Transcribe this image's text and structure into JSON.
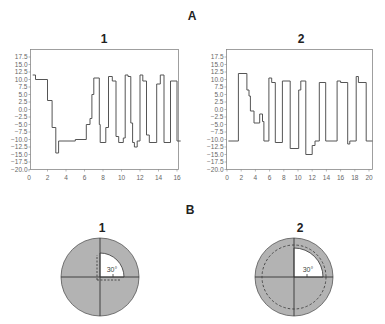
{
  "panels": {
    "A_label": "A",
    "B_label": "B"
  },
  "chart_data": [
    {
      "type": "line",
      "title": "1",
      "step": true,
      "xlabel": "",
      "ylabel": "",
      "xlim": [
        0,
        16.4
      ],
      "ylim": [
        -20,
        20
      ],
      "xticks": [
        0,
        2,
        4,
        6,
        8,
        10,
        12,
        14,
        16
      ],
      "yticks": [
        17.5,
        15.0,
        12.5,
        10.0,
        7.5,
        5.0,
        2.5,
        0.0,
        -2.5,
        -5.0,
        -7.5,
        -10.0,
        -12.5,
        -15.0,
        -17.5,
        -20.0
      ],
      "grid": false,
      "color": "#555555",
      "points": [
        [
          0.4,
          11.5
        ],
        [
          0.7,
          11.5
        ],
        [
          0.7,
          10.0
        ],
        [
          2.0,
          10.0
        ],
        [
          2.0,
          3.0
        ],
        [
          2.5,
          3.0
        ],
        [
          2.5,
          -6.0
        ],
        [
          2.9,
          -6.0
        ],
        [
          2.9,
          -14.5
        ],
        [
          3.2,
          -14.5
        ],
        [
          3.2,
          -10.5
        ],
        [
          5.0,
          -10.5
        ],
        [
          5.0,
          -10.0
        ],
        [
          6.2,
          -10.0
        ],
        [
          6.2,
          -5.0
        ],
        [
          6.6,
          -5.0
        ],
        [
          6.6,
          -3.0
        ],
        [
          6.8,
          -3.0
        ],
        [
          6.8,
          5.0
        ],
        [
          7.0,
          5.0
        ],
        [
          7.0,
          10.5
        ],
        [
          7.6,
          10.5
        ],
        [
          7.6,
          -5.0
        ],
        [
          7.7,
          -5.0
        ],
        [
          7.7,
          -11.0
        ],
        [
          8.3,
          -11.0
        ],
        [
          8.3,
          -6.0
        ],
        [
          8.6,
          -6.0
        ],
        [
          8.6,
          11.0
        ],
        [
          9.0,
          11.0
        ],
        [
          9.0,
          9.5
        ],
        [
          9.4,
          9.5
        ],
        [
          9.4,
          -9.0
        ],
        [
          9.7,
          -9.0
        ],
        [
          9.7,
          -11.0
        ],
        [
          10.2,
          -11.0
        ],
        [
          10.2,
          -9.5
        ],
        [
          10.4,
          -9.5
        ],
        [
          10.4,
          11.5
        ],
        [
          10.7,
          11.5
        ],
        [
          10.7,
          11.0
        ],
        [
          11.0,
          11.0
        ],
        [
          11.0,
          -4.5
        ],
        [
          11.2,
          -4.5
        ],
        [
          11.2,
          -11.0
        ],
        [
          11.4,
          -11.0
        ],
        [
          11.4,
          -12.5
        ],
        [
          11.7,
          -12.5
        ],
        [
          11.7,
          -10.5
        ],
        [
          12.0,
          -10.5
        ],
        [
          12.0,
          11.5
        ],
        [
          12.3,
          11.5
        ],
        [
          12.3,
          9.5
        ],
        [
          12.7,
          9.5
        ],
        [
          12.7,
          -8.5
        ],
        [
          13.0,
          -8.5
        ],
        [
          13.0,
          -11.0
        ],
        [
          13.8,
          -11.0
        ],
        [
          13.8,
          8.5
        ],
        [
          14.2,
          8.5
        ],
        [
          14.2,
          11.5
        ],
        [
          14.6,
          11.5
        ],
        [
          14.6,
          -11.0
        ],
        [
          15.3,
          -11.0
        ],
        [
          15.3,
          9.5
        ],
        [
          16.0,
          9.5
        ],
        [
          16.0,
          -10.5
        ],
        [
          16.4,
          -10.5
        ]
      ]
    },
    {
      "type": "line",
      "title": "2",
      "step": true,
      "xlabel": "",
      "ylabel": "",
      "xlim": [
        0,
        20.5
      ],
      "ylim": [
        -20,
        20
      ],
      "xticks": [
        0,
        2,
        4,
        6,
        8,
        10,
        12,
        14,
        16,
        18,
        20
      ],
      "yticks": [
        17.5,
        15.0,
        12.5,
        10.0,
        7.5,
        5.0,
        2.5,
        0.0,
        -2.5,
        -5.0,
        -7.5,
        -10.0,
        -12.5,
        -15.0,
        -17.5,
        -20.0
      ],
      "grid": false,
      "color": "#555555",
      "points": [
        [
          0.2,
          -10.5
        ],
        [
          1.6,
          -10.5
        ],
        [
          1.6,
          12.0
        ],
        [
          2.8,
          12.0
        ],
        [
          2.8,
          6.5
        ],
        [
          3.1,
          6.5
        ],
        [
          3.1,
          4.5
        ],
        [
          3.3,
          4.5
        ],
        [
          3.3,
          -0.5
        ],
        [
          3.8,
          -0.5
        ],
        [
          3.8,
          -4.5
        ],
        [
          4.6,
          -4.5
        ],
        [
          4.6,
          -1.5
        ],
        [
          5.0,
          -1.5
        ],
        [
          5.0,
          -4.0
        ],
        [
          5.2,
          -4.0
        ],
        [
          5.2,
          -10.5
        ],
        [
          5.9,
          -10.5
        ],
        [
          5.9,
          10.5
        ],
        [
          6.3,
          10.5
        ],
        [
          6.3,
          9.0
        ],
        [
          6.8,
          9.0
        ],
        [
          6.8,
          -11.0
        ],
        [
          7.8,
          -11.0
        ],
        [
          7.8,
          9.5
        ],
        [
          8.9,
          9.5
        ],
        [
          8.9,
          -13.0
        ],
        [
          10.1,
          -13.0
        ],
        [
          10.1,
          6.5
        ],
        [
          10.4,
          6.5
        ],
        [
          10.4,
          9.5
        ],
        [
          11.1,
          9.5
        ],
        [
          11.1,
          -15.0
        ],
        [
          12.0,
          -15.0
        ],
        [
          12.0,
          -12.0
        ],
        [
          12.4,
          -12.0
        ],
        [
          12.4,
          -10.5
        ],
        [
          13.0,
          -10.5
        ],
        [
          13.0,
          9.0
        ],
        [
          13.9,
          9.0
        ],
        [
          13.9,
          -10.5
        ],
        [
          15.5,
          -10.5
        ],
        [
          15.5,
          9.5
        ],
        [
          16.0,
          9.5
        ],
        [
          16.0,
          9.0
        ],
        [
          17.0,
          9.0
        ],
        [
          17.0,
          -11.5
        ],
        [
          17.3,
          -11.5
        ],
        [
          17.3,
          -10.5
        ],
        [
          18.2,
          -10.5
        ],
        [
          18.2,
          11.0
        ],
        [
          18.5,
          11.0
        ],
        [
          18.5,
          9.0
        ],
        [
          19.6,
          9.0
        ],
        [
          19.6,
          -10.5
        ],
        [
          20.5,
          -10.5
        ]
      ]
    }
  ],
  "diagrams": [
    {
      "title": "1",
      "angle_label": "30°",
      "fill_color": "#b3b3b3",
      "quadrant_color": "#ffffff",
      "dashed": "quadrant-outline"
    },
    {
      "title": "2",
      "angle_label": "30°",
      "fill_color": "#b3b3b3",
      "quadrant_color": "#ffffff",
      "dashed": "full-circle"
    }
  ]
}
